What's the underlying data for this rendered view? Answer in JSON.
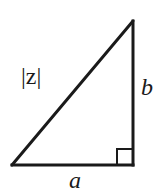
{
  "diagram": {
    "type": "right-triangle",
    "stroke_color": "#1a1a1a",
    "background": "#ffffff",
    "vertices": {
      "bottom_left": [
        12,
        165
      ],
      "bottom_right": [
        133,
        165
      ],
      "top_right": [
        133,
        21
      ]
    },
    "right_angle_marker": {
      "corner": "bottom_right",
      "size": 16
    },
    "labels": {
      "hypotenuse": "|z|",
      "vertical_leg": "b",
      "horizontal_leg": "a"
    }
  }
}
